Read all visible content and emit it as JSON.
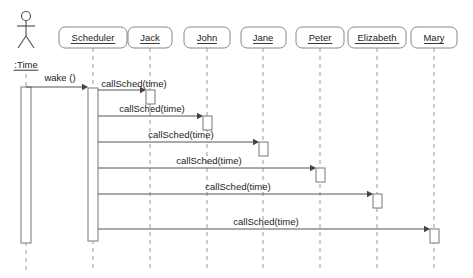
{
  "diagram": {
    "type": "uml-sequence-diagram",
    "background_color": "#ffffff",
    "line_color": "#555555",
    "box_border_color": "#888888",
    "lifeline_color": "#999999"
  },
  "actor": {
    "name": "time-actor",
    "label": ":Time",
    "icon": "stick-figure-actor-icon",
    "x": 26,
    "head_cy": 16,
    "label_y": 68,
    "activation": {
      "x": 21,
      "y": 87,
      "width": 10,
      "height": 156
    },
    "lifeline_top": 74,
    "lifeline_bottom": 272
  },
  "lifelines": [
    {
      "name": "scheduler",
      "label": "Scheduler",
      "x": 93,
      "box_x": 59,
      "box_w": 68
    },
    {
      "name": "jack",
      "label": "Jack",
      "x": 150,
      "box_x": 128,
      "box_w": 44
    },
    {
      "name": "john",
      "label": "John",
      "x": 207,
      "box_x": 184,
      "box_w": 46
    },
    {
      "name": "jane",
      "label": "Jane",
      "x": 263,
      "box_x": 241,
      "box_w": 45
    },
    {
      "name": "peter",
      "label": "Peter",
      "x": 320,
      "box_x": 296,
      "box_w": 48
    },
    {
      "name": "elizabeth",
      "label": "Elizabeth",
      "x": 377,
      "box_x": 348,
      "box_w": 58
    },
    {
      "name": "mary",
      "label": "Mary",
      "x": 434,
      "box_x": 411,
      "box_w": 46
    }
  ],
  "lifeline_geometry": {
    "box_y": 27,
    "box_h": 21,
    "dash_top": 48,
    "dash_bottom": 272
  },
  "scheduler_activation": {
    "x": 88,
    "y": 88,
    "width": 10,
    "height": 153
  },
  "messages": [
    {
      "name": "wake-message",
      "label": "wake ()",
      "from": "time-actor",
      "to": "scheduler",
      "from_x": 26,
      "to_x": 88,
      "y": 87,
      "label_x": 60,
      "label_y": 81,
      "target_activation": null
    },
    {
      "name": "callsched-jack-message",
      "label": "callSched(time)",
      "from": "scheduler",
      "to": "jack",
      "from_x": 98,
      "to_x": 146,
      "y": 90,
      "label_x": 134,
      "label_y": 87,
      "target_activation": {
        "x": 146,
        "y": 90,
        "width": 9,
        "height": 14
      }
    },
    {
      "name": "callsched-john-message",
      "label": "callSched(time)",
      "from": "scheduler",
      "to": "john",
      "from_x": 98,
      "to_x": 203,
      "y": 116,
      "label_x": 152,
      "label_y": 112,
      "target_activation": {
        "x": 203,
        "y": 116,
        "width": 9,
        "height": 14
      }
    },
    {
      "name": "callsched-jane-message",
      "label": "callSched(time)",
      "from": "scheduler",
      "to": "jane",
      "from_x": 98,
      "to_x": 259,
      "y": 142,
      "label_x": 181,
      "label_y": 138,
      "target_activation": {
        "x": 259,
        "y": 142,
        "width": 9,
        "height": 14
      }
    },
    {
      "name": "callsched-peter-message",
      "label": "callSched(time)",
      "from": "scheduler",
      "to": "peter",
      "from_x": 98,
      "to_x": 316,
      "y": 168,
      "label_x": 209,
      "label_y": 164,
      "target_activation": {
        "x": 316,
        "y": 168,
        "width": 9,
        "height": 14
      }
    },
    {
      "name": "callsched-elizabeth-message",
      "label": "callSched(time)",
      "from": "scheduler",
      "to": "elizabeth",
      "from_x": 98,
      "to_x": 373,
      "y": 194,
      "label_x": 238,
      "label_y": 190,
      "target_activation": {
        "x": 373,
        "y": 194,
        "width": 9,
        "height": 14
      }
    },
    {
      "name": "callsched-mary-message",
      "label": "callSched(time)",
      "from": "scheduler",
      "to": "mary",
      "from_x": 98,
      "to_x": 430,
      "y": 229,
      "label_x": 266,
      "label_y": 225,
      "target_activation": {
        "x": 430,
        "y": 229,
        "width": 9,
        "height": 14
      }
    }
  ]
}
